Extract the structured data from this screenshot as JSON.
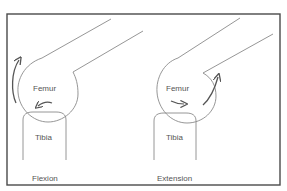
{
  "diagram": {
    "type": "knee-joint-roll-glide",
    "colors": {
      "border": "#4a4a4a",
      "outline": "#8a8a8a",
      "arrow": "#555555",
      "text": "#555555"
    },
    "panels": [
      {
        "caption": "Flexion",
        "femur_label": "Femur",
        "tibia_label": "Tibia",
        "roll_arrow": "counterclockwise-up",
        "glide_arrow": "left"
      },
      {
        "caption": "Extension",
        "femur_label": "Femur",
        "tibia_label": "Tibia",
        "roll_arrow": "clockwise-up",
        "glide_arrow": "right"
      }
    ]
  }
}
